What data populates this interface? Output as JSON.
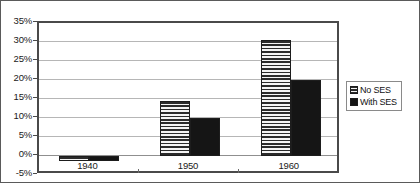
{
  "chart_data": {
    "type": "bar",
    "title": "",
    "subtitle": "",
    "xlabel": "",
    "ylabel": "",
    "categories": [
      "1940",
      "1950",
      "1960"
    ],
    "series": [
      {
        "name": "No SES",
        "values": [
          -1.2,
          14.5,
          30.5
        ],
        "pattern": "horizontal-stripes",
        "color": "#f2f2f2"
      },
      {
        "name": "With SES",
        "values": [
          -1.2,
          10.0,
          20.0
        ],
        "pattern": "solid",
        "color": "#151515"
      }
    ],
    "ylim": [
      -5,
      35
    ],
    "ytick_values": [
      35,
      30,
      25,
      20,
      15,
      10,
      5,
      0,
      -5
    ],
    "ytick_labels": [
      "35%",
      "30%",
      "25%",
      "20%",
      "15%",
      "10%",
      "5%",
      "0%",
      "-5%"
    ],
    "grid": true,
    "grid_axis": "y",
    "legend_position": "right",
    "value_format": "percent",
    "annotations": []
  },
  "legend": {
    "entries": [
      {
        "label": "No SES"
      },
      {
        "label": "With SES"
      }
    ]
  }
}
